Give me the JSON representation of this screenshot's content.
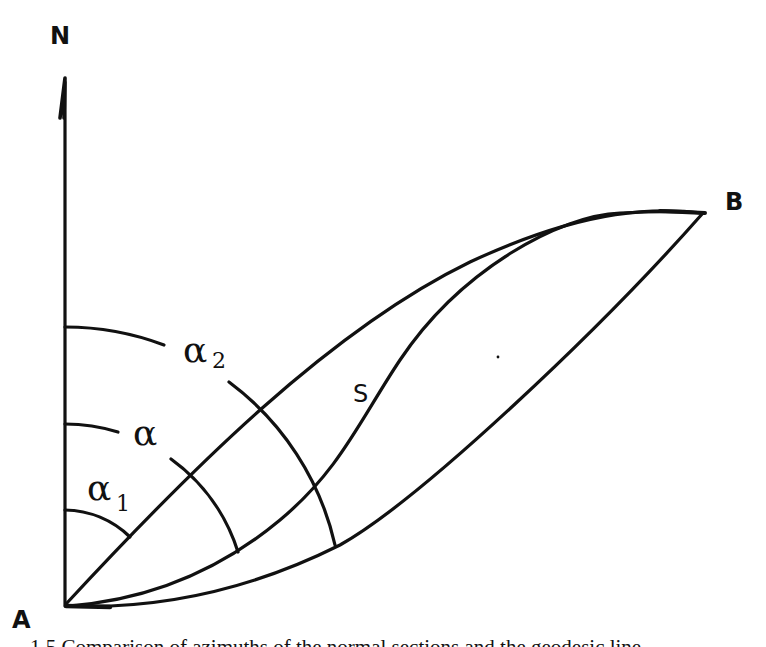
{
  "diagram": {
    "labels": {
      "north": "N",
      "point_a": "A",
      "point_b": "B",
      "geodesic": "S",
      "alpha1": "α",
      "alpha1_sub": "1",
      "alpha": "α",
      "alpha2": "α",
      "alpha2_sub": "2"
    },
    "elements": [
      {
        "id": "north-axis",
        "type": "arrow",
        "from": "A",
        "to": "N"
      },
      {
        "id": "normal-section-upper",
        "type": "curve",
        "from": "A",
        "to": "B",
        "azimuth": "α1"
      },
      {
        "id": "geodesic-s",
        "type": "curve",
        "from": "A",
        "to": "B",
        "azimuth": "α"
      },
      {
        "id": "normal-section-lower",
        "type": "curve",
        "from": "A",
        "to": "B",
        "azimuth": "α2"
      }
    ]
  },
  "caption": {
    "text": "1.5 Comparison of azimuths of the normal sections and the geodesic line"
  }
}
